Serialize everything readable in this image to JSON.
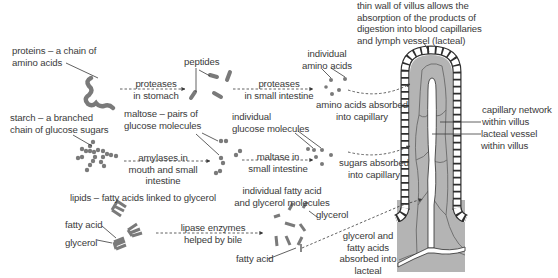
{
  "diagram": {
    "colors": {
      "molecule": "#7a7a7a",
      "villus_fill": "#b4b4b4",
      "text": "#3a3a3a",
      "line": "#3a3a3a"
    },
    "proteins": {
      "source_label": [
        "proteins – a chain of",
        "amino acids"
      ],
      "step1_enzyme": [
        "proteases",
        "in stomach"
      ],
      "intermediate_label": "peptides",
      "step2_enzyme": [
        "proteases",
        "in small intestine"
      ],
      "product_label": [
        "individual",
        "amino acids"
      ],
      "absorption_label": [
        "amino acids absorbed",
        "into capillary"
      ]
    },
    "starch": {
      "source_label": [
        "starch – a branched",
        "chain of glucose sugars"
      ],
      "step1_enzyme": [
        "amylases in",
        "mouth and small",
        "intestine"
      ],
      "intermediate_label": [
        "maltose – pairs of",
        "glucose molecules"
      ],
      "step2_enzyme": [
        "maltase in",
        "small intestine"
      ],
      "product_label": [
        "individual",
        "glucose molecules"
      ],
      "absorption_label": [
        "sugars absorbed",
        "into capillary"
      ]
    },
    "lipids": {
      "source_title": "lipids – fatty acids linked to glycerol",
      "fatty_acid_label": "fatty acid",
      "glycerol_label": "glycerol",
      "enzyme": [
        "lipase enzymes",
        "helped by bile"
      ],
      "product_label": [
        "individual fatty acid",
        "and glycerol molecules"
      ],
      "product_glycerol_label": "glycerol",
      "product_fatty_acid_label": "fatty acid",
      "absorption_label": [
        "glycerol and",
        "fatty acids",
        "absorbed into",
        "lacteal"
      ]
    },
    "villus": {
      "wall_label": [
        "thin wall of villus allows the",
        "absorption of the products of",
        "digestion into blood capillaries",
        "and lymph vessel (lacteal)"
      ],
      "capillary_label": [
        "capillary network",
        "within villus"
      ],
      "lacteal_label": [
        "lacteal vessel",
        "within villus"
      ]
    }
  }
}
